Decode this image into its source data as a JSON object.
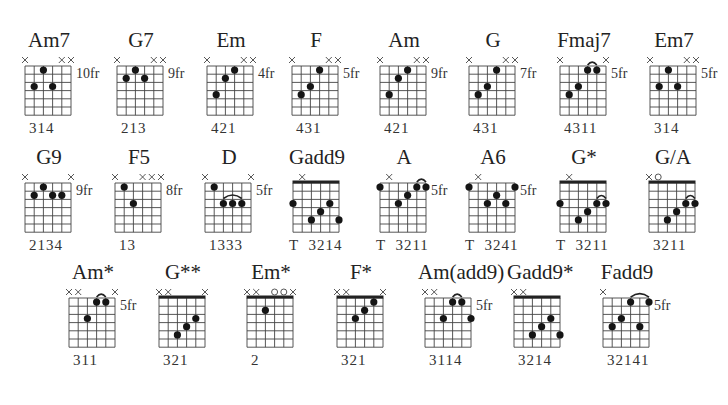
{
  "layout": {
    "grid": {
      "strings": 6,
      "frets": 6,
      "string_spacing": 9.2,
      "fret_spacing": 8.2
    }
  },
  "chords": [
    {
      "name": "Am7",
      "x": 18,
      "y": 28,
      "fret_label": "10fr",
      "fingering": "314",
      "nut": false,
      "mutes": [
        0,
        4,
        5
      ],
      "opens": [],
      "dots": [
        [
          2,
          1
        ],
        [
          1,
          3
        ],
        [
          3,
          3
        ]
      ],
      "arcs": []
    },
    {
      "name": "G7",
      "x": 110,
      "y": 28,
      "fret_label": "9fr",
      "fingering": "213",
      "nut": false,
      "mutes": [
        0,
        4,
        5
      ],
      "opens": [],
      "dots": [
        [
          2,
          1
        ],
        [
          1,
          2
        ],
        [
          3,
          2
        ]
      ],
      "arcs": []
    },
    {
      "name": "Em",
      "x": 200,
      "y": 28,
      "fret_label": "4fr",
      "fingering": "421",
      "nut": false,
      "mutes": [
        0,
        4,
        5
      ],
      "opens": [],
      "dots": [
        [
          3,
          1
        ],
        [
          2,
          2
        ],
        [
          1,
          4
        ]
      ],
      "arcs": []
    },
    {
      "name": "F",
      "x": 285,
      "y": 28,
      "fret_label": "5fr",
      "fingering": "431",
      "nut": false,
      "mutes": [
        0,
        4,
        5
      ],
      "opens": [],
      "dots": [
        [
          3,
          1
        ],
        [
          2,
          3
        ],
        [
          1,
          4
        ]
      ],
      "arcs": []
    },
    {
      "name": "Am",
      "x": 373,
      "y": 28,
      "fret_label": "9fr",
      "fingering": "421",
      "nut": false,
      "mutes": [
        0,
        4,
        5
      ],
      "opens": [],
      "dots": [
        [
          3,
          1
        ],
        [
          2,
          2
        ],
        [
          1,
          4
        ]
      ],
      "arcs": []
    },
    {
      "name": "G",
      "x": 462,
      "y": 28,
      "fret_label": "7fr",
      "fingering": "431",
      "nut": false,
      "mutes": [
        0,
        4,
        5
      ],
      "opens": [],
      "dots": [
        [
          3,
          1
        ],
        [
          2,
          3
        ],
        [
          1,
          4
        ]
      ],
      "arcs": []
    },
    {
      "name": "Fmaj7",
      "x": 553,
      "y": 28,
      "fret_label": "5fr",
      "fingering": "4311",
      "nut": false,
      "mutes": [
        0,
        5
      ],
      "opens": [],
      "dots": [
        [
          3,
          1
        ],
        [
          4,
          1
        ],
        [
          2,
          3
        ],
        [
          1,
          4
        ]
      ],
      "arcs": [
        [
          3,
          4
        ]
      ]
    },
    {
      "name": "Em7",
      "x": 643,
      "y": 28,
      "fret_label": "5fr",
      "fingering": "314",
      "nut": false,
      "mutes": [
        0,
        4,
        5
      ],
      "opens": [],
      "dots": [
        [
          2,
          1
        ],
        [
          1,
          3
        ],
        [
          3,
          3
        ]
      ],
      "arcs": []
    },
    {
      "name": "G9",
      "x": 18,
      "y": 145,
      "fret_label": "9fr",
      "fingering": "2134",
      "nut": false,
      "mutes": [
        0,
        5
      ],
      "opens": [],
      "dots": [
        [
          2,
          1
        ],
        [
          1,
          2
        ],
        [
          3,
          2
        ],
        [
          4,
          2
        ]
      ],
      "arcs": []
    },
    {
      "name": "F5",
      "x": 108,
      "y": 145,
      "fret_label": "8fr",
      "fingering": "13",
      "nut": false,
      "mutes": [
        0,
        3,
        4,
        5
      ],
      "opens": [],
      "dots": [
        [
          1,
          1
        ],
        [
          2,
          3
        ]
      ],
      "arcs": []
    },
    {
      "name": "D",
      "x": 198,
      "y": 145,
      "fret_label": "5fr",
      "fingering": "1333",
      "nut": false,
      "mutes": [
        0,
        5
      ],
      "opens": [],
      "dots": [
        [
          1,
          1
        ],
        [
          2,
          3
        ],
        [
          3,
          3
        ],
        [
          4,
          3
        ]
      ],
      "arcs": [
        [
          2,
          4
        ]
      ]
    },
    {
      "name": "Gadd9",
      "x": 286,
      "y": 145,
      "fret_label": "",
      "fingering": "T  3214",
      "nut": true,
      "mutes": [
        1
      ],
      "opens": [],
      "dots": [
        [
          0,
          3
        ],
        [
          2,
          5
        ],
        [
          3,
          4
        ],
        [
          4,
          3
        ],
        [
          5,
          5
        ]
      ],
      "arcs": []
    },
    {
      "name": "A",
      "x": 373,
      "y": 145,
      "fret_label": "5fr",
      "fingering": "T  3211",
      "nut": false,
      "mutes": [
        1
      ],
      "opens": [],
      "dots": [
        [
          0,
          1
        ],
        [
          2,
          3
        ],
        [
          3,
          2
        ],
        [
          4,
          1
        ],
        [
          5,
          1
        ]
      ],
      "arcs": [
        [
          4,
          5
        ]
      ]
    },
    {
      "name": "A6",
      "x": 462,
      "y": 145,
      "fret_label": "5fr",
      "fingering": "T  3241",
      "nut": false,
      "mutes": [
        1
      ],
      "opens": [],
      "dots": [
        [
          0,
          1
        ],
        [
          2,
          3
        ],
        [
          3,
          2
        ],
        [
          4,
          3
        ],
        [
          5,
          1
        ]
      ],
      "arcs": []
    },
    {
      "name": "G*",
      "x": 553,
      "y": 145,
      "fret_label": "",
      "fingering": "T  3211",
      "nut": true,
      "mutes": [
        1
      ],
      "opens": [],
      "dots": [
        [
          0,
          3
        ],
        [
          2,
          5
        ],
        [
          3,
          4
        ],
        [
          4,
          3
        ],
        [
          5,
          3
        ]
      ],
      "arcs": [
        [
          4,
          5
        ]
      ]
    },
    {
      "name": "G/A",
      "x": 642,
      "y": 145,
      "fret_label": "",
      "fingering": "3211",
      "nut": true,
      "mutes": [
        0
      ],
      "opens": [
        1
      ],
      "dots": [
        [
          2,
          5
        ],
        [
          3,
          4
        ],
        [
          4,
          3
        ],
        [
          5,
          3
        ]
      ],
      "arcs": [
        [
          4,
          5
        ]
      ]
    },
    {
      "name": "Am*",
      "x": 62,
      "y": 260,
      "fret_label": "5fr",
      "fingering": "311",
      "nut": false,
      "mutes": [
        0,
        1,
        5
      ],
      "opens": [],
      "dots": [
        [
          2,
          3
        ],
        [
          3,
          1
        ],
        [
          4,
          1
        ]
      ],
      "arcs": [
        [
          3,
          4
        ]
      ]
    },
    {
      "name": "G**",
      "x": 152,
      "y": 260,
      "fret_label": "",
      "fingering": "321",
      "nut": true,
      "mutes": [
        0,
        1,
        5
      ],
      "opens": [],
      "dots": [
        [
          2,
          5
        ],
        [
          3,
          4
        ],
        [
          4,
          3
        ]
      ],
      "arcs": []
    },
    {
      "name": "Em*",
      "x": 240,
      "y": 260,
      "fret_label": "",
      "fingering": "2",
      "nut": true,
      "mutes": [
        0,
        1,
        5
      ],
      "opens": [
        3,
        4
      ],
      "dots": [
        [
          2,
          2
        ]
      ],
      "arcs": []
    },
    {
      "name": "F*",
      "x": 330,
      "y": 260,
      "fret_label": "",
      "fingering": "321",
      "nut": true,
      "mutes": [
        0,
        1,
        5
      ],
      "opens": [],
      "dots": [
        [
          2,
          3
        ],
        [
          3,
          2
        ],
        [
          4,
          1
        ]
      ],
      "arcs": []
    },
    {
      "name": "Am(add9)",
      "x": 418,
      "y": 260,
      "fret_label": "5fr",
      "fingering": "3114",
      "nut": false,
      "mutes": [
        0,
        1
      ],
      "opens": [],
      "dots": [
        [
          2,
          3
        ],
        [
          3,
          1
        ],
        [
          4,
          1
        ],
        [
          5,
          3
        ]
      ],
      "arcs": [
        [
          3,
          4
        ]
      ]
    },
    {
      "name": "Gadd9*",
      "x": 507,
      "y": 260,
      "fret_label": "",
      "fingering": "3214",
      "nut": true,
      "mutes": [
        0,
        1
      ],
      "opens": [],
      "dots": [
        [
          2,
          5
        ],
        [
          3,
          4
        ],
        [
          4,
          3
        ],
        [
          5,
          5
        ]
      ],
      "arcs": []
    },
    {
      "name": "Fadd9",
      "x": 596,
      "y": 260,
      "fret_label": "5fr",
      "fingering": "32141",
      "nut": false,
      "mutes": [
        0
      ],
      "opens": [],
      "dots": [
        [
          1,
          4
        ],
        [
          2,
          3
        ],
        [
          3,
          1
        ],
        [
          4,
          4
        ],
        [
          5,
          1
        ]
      ],
      "arcs": [
        [
          3,
          5
        ]
      ]
    }
  ]
}
